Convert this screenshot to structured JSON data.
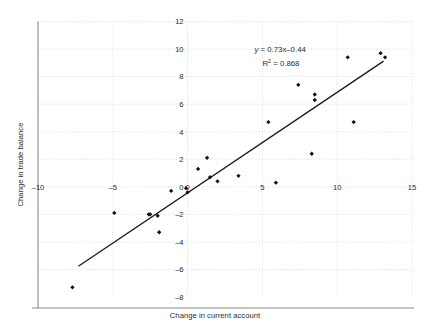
{
  "chart_data": {
    "type": "scatter",
    "title": "",
    "xlabel": "Change in current account",
    "ylabel": "Change in trade balance",
    "xlim": [
      -10,
      15
    ],
    "ylim": [
      -8,
      12
    ],
    "xticks": [
      -10,
      -5,
      0,
      5,
      10,
      15
    ],
    "yticks": [
      -8,
      -6,
      -4,
      -2,
      0,
      2,
      4,
      6,
      8,
      10,
      12
    ],
    "xtick_labels": [
      "–10",
      "–5",
      "0",
      "5",
      "10",
      "15"
    ],
    "ytick_labels": [
      "–8",
      "–6",
      "–4",
      "–2",
      "0",
      "2",
      "4",
      "6",
      "8",
      "10",
      "12"
    ],
    "grid": true,
    "legend": "none",
    "marker": "diamond",
    "marker_color": "#111111",
    "line_color": "#1a1a1a",
    "grid_color": "#d0d0d0",
    "axis_color": "#8a8a8a",
    "annotations": [
      {
        "text": "y = 0.73x–0.44",
        "x": 4.2,
        "y": 9.8
      },
      {
        "text": "R² = 0.868",
        "x": 4.2,
        "y": 8.8
      }
    ],
    "fit": {
      "slope": 0.73,
      "intercept": -0.44,
      "r_squared": 0.868,
      "x_start": -7.3,
      "x_end": 13.1
    },
    "points": [
      {
        "x": -7.7,
        "y": -7.3
      },
      {
        "x": -4.9,
        "y": -1.9
      },
      {
        "x": -2.6,
        "y": -2.0
      },
      {
        "x": -2.5,
        "y": -2.0
      },
      {
        "x": -2.0,
        "y": -2.1
      },
      {
        "x": -1.9,
        "y": -3.3
      },
      {
        "x": -1.1,
        "y": -0.3
      },
      {
        "x": -0.1,
        "y": -0.1
      },
      {
        "x": 0.0,
        "y": -0.4
      },
      {
        "x": 0.7,
        "y": 1.3
      },
      {
        "x": 1.3,
        "y": 2.1
      },
      {
        "x": 1.5,
        "y": 0.7
      },
      {
        "x": 2.0,
        "y": 0.4
      },
      {
        "x": 3.4,
        "y": 0.8
      },
      {
        "x": 5.4,
        "y": 4.7
      },
      {
        "x": 5.9,
        "y": 0.3
      },
      {
        "x": 7.4,
        "y": 7.4
      },
      {
        "x": 8.3,
        "y": 2.4
      },
      {
        "x": 8.5,
        "y": 6.7
      },
      {
        "x": 8.5,
        "y": 6.3
      },
      {
        "x": 10.7,
        "y": 9.4
      },
      {
        "x": 11.1,
        "y": 4.7
      },
      {
        "x": 12.9,
        "y": 9.7
      },
      {
        "x": 13.2,
        "y": 9.4
      }
    ]
  }
}
